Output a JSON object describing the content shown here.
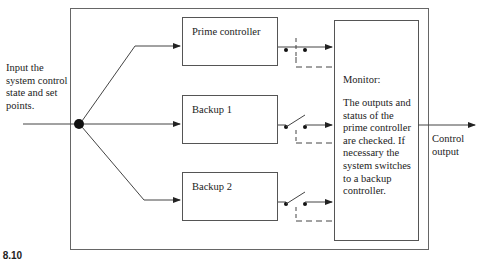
{
  "diagram": {
    "input_label": [
      "Input the",
      "system control",
      "state and set",
      "points."
    ],
    "controllers": [
      {
        "label": "Prime controller",
        "switch": "closed"
      },
      {
        "label": "Backup 1",
        "switch": "open"
      },
      {
        "label": "Backup 2",
        "switch": "open"
      }
    ],
    "monitor": {
      "title": "Monitor:",
      "description": [
        "The outputs and",
        "status of the",
        "prime controller",
        "are checked. If",
        "necessary the",
        "system switches",
        "to a backup",
        "controller."
      ]
    },
    "output_label": [
      "Control",
      "output"
    ],
    "caption": "RE 8.10",
    "colors": {
      "line": "#444444",
      "box": "#555555",
      "text": "#222222",
      "background": "#ffffff"
    }
  }
}
